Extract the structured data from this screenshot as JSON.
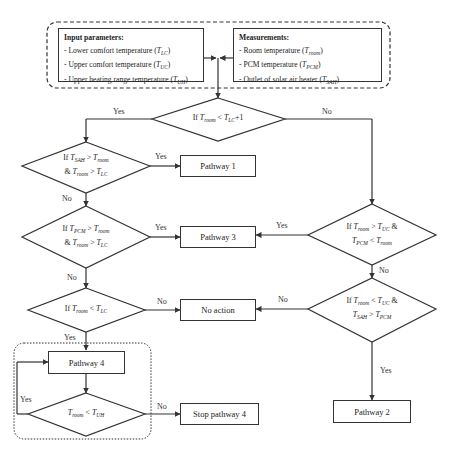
{
  "input_parameters": {
    "heading": "Input parameters:",
    "items": [
      {
        "text": "- Lower comfort temperature (",
        "sym": "T",
        "sub": "LC",
        "close": ")"
      },
      {
        "text": "- Upper comfort temperature (",
        "sym": "T",
        "sub": "UC",
        "close": ")"
      },
      {
        "text": "- Upper heating range temperature (",
        "sym": "T",
        "sub": "UH",
        "close": ")"
      }
    ]
  },
  "measurements": {
    "heading": "Measurements:",
    "items": [
      {
        "text": "- Room temperature (",
        "sym": "T",
        "sub": "room",
        "close": ")"
      },
      {
        "text": "- PCM temperature (",
        "sym": "T",
        "sub": "PCM",
        "close": ")"
      },
      {
        "text": "- Outlet of solar air heater (",
        "sym": "T",
        "sub": "SAH",
        "close": ")"
      }
    ]
  },
  "decisions": {
    "d1": {
      "line1": "If T_room < T_LC+1"
    },
    "d2": {
      "line1": "If T_SAH > T_room",
      "line2": "& T_room > T_LC"
    },
    "d3": {
      "line1": "If T_PCM > T_room",
      "line2": "& T_room > T_LC"
    },
    "d4": {
      "line1": "If T_room < T_LC"
    },
    "d5": {
      "line1": "T_room < T_UH"
    },
    "r1": {
      "line1": "If T_room > T_UC &",
      "line2": "T_PCM < T_room"
    },
    "r2": {
      "line1": "If T_room < T_UC &",
      "line2": "T_SAH > T_PCM"
    }
  },
  "processes": {
    "pathway1": "Pathway 1",
    "pathway2": "Pathway 2",
    "pathway3": "Pathway 3",
    "pathway4": "Pathway 4",
    "no_action": "No action",
    "stop_pathway4": "Stop pathway 4"
  },
  "edge_labels": {
    "d1_yes": "Yes",
    "d1_no": "No",
    "d2_yes": "Yes",
    "d2_no": "No",
    "d3_yes": "Yes",
    "d3_no": "No",
    "d4_no": "No",
    "d4_yes": "Yes",
    "d5_yes": "Yes",
    "d5_no": "No",
    "r1_yes": "Yes",
    "r1_no": "No",
    "r2_no": "No",
    "r2_yes": "Yes"
  }
}
